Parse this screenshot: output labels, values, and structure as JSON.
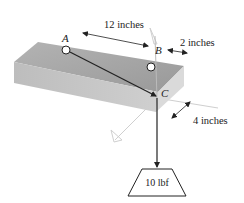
{
  "figure": {
    "points": {
      "A": "A",
      "B": "B",
      "C": "C"
    },
    "dimensions": {
      "length_AB": "12 inches",
      "offset_B": "2 inches",
      "depth": "4 inches"
    },
    "load": {
      "label": "10 lbf"
    },
    "colors": {
      "block_top": "#a9a9a9",
      "block_front": "#c4c4c4",
      "cable": "#222222",
      "axis_ghost": "#c8c8c8"
    }
  }
}
